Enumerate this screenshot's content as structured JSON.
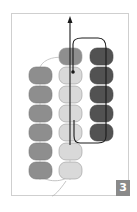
{
  "diagram": {
    "step_number": "3",
    "colors": {
      "frame_border": "#cfcfcf",
      "bead_medium": "#8e8e8e",
      "bead_light": "#d9d9d9",
      "bead_dark": "#525252",
      "thread_active": "#1a1a1a",
      "thread_passive": "#b5b5b5",
      "badge_bg": "#8a8a8a",
      "badge_text": "#ffffff"
    },
    "columns": [
      {
        "name": "left",
        "color": "medium",
        "bead_count": 6
      },
      {
        "name": "middle",
        "color": "light",
        "bead_count": 6,
        "top_bead_color": "medium"
      },
      {
        "name": "right",
        "color": "dark",
        "bead_count": 5
      }
    ],
    "annotations": {
      "arrow_direction": "up",
      "needle_exit_marker": "dot"
    }
  }
}
